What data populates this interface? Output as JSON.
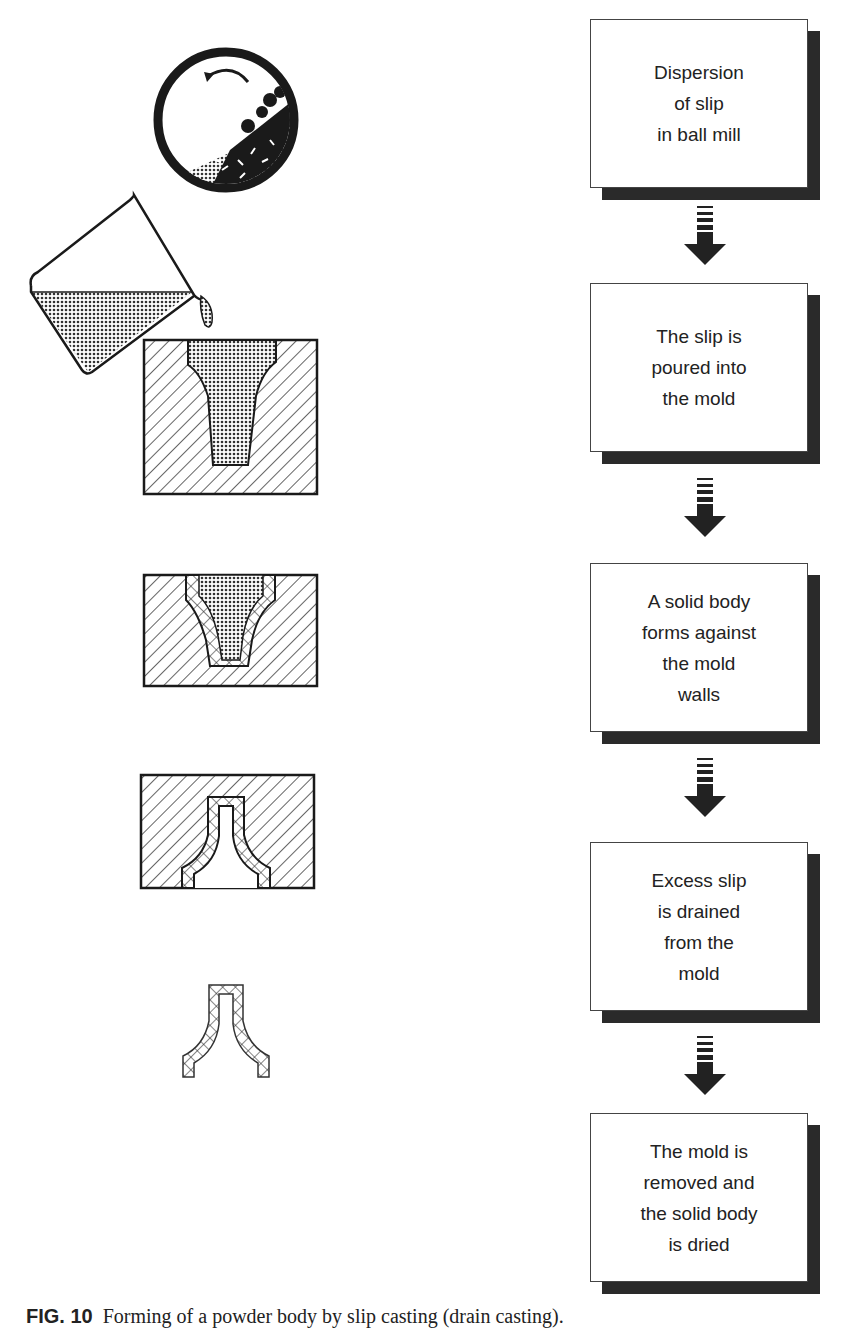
{
  "figure": {
    "caption_label": "FIG. 10",
    "caption_text": "Forming of a powder body by slip casting (drain casting)."
  },
  "flowchart": {
    "steps": [
      {
        "text": "Dispersion\nof slip\nin ball mill"
      },
      {
        "text": "The slip is\npoured into\nthe mold"
      },
      {
        "text": "A solid body\nforms against\nthe mold\nwalls"
      },
      {
        "text": "Excess slip\nis drained\nfrom the\nmold"
      },
      {
        "text": "The mold is\nremoved and\nthe solid body\nis dried"
      }
    ]
  },
  "illustrations": [
    {
      "name": "ball-mill",
      "description": "Rotating ball mill with slip and milling balls"
    },
    {
      "name": "pouring-beaker",
      "description": "Beaker pouring slip into mold"
    },
    {
      "name": "mold-filled",
      "description": "Mold filled with slip"
    },
    {
      "name": "mold-wall-formation",
      "description": "Solid layer forming against mold walls"
    },
    {
      "name": "mold-drained",
      "description": "Excess slip drained, shell remains"
    },
    {
      "name": "dried-body",
      "description": "Removed, dried hollow body"
    }
  ],
  "colors": {
    "ink": "#1a1a1a",
    "shadow": "#2a2a2a",
    "paper": "#ffffff"
  }
}
